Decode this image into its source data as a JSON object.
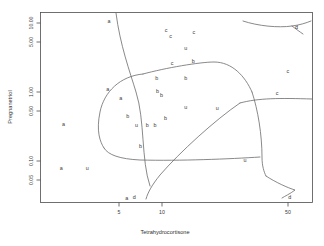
{
  "chart_data": {
    "type": "scatter",
    "title": "",
    "subtitle": "",
    "xlabel": "Tetrahydrocortisone",
    "ylabel": "Pregnanetriol",
    "xscale": "log",
    "yscale": "log",
    "xlim": [
      3.2,
      60
    ],
    "ylim": [
      0.035,
      13.5
    ],
    "xticks": [
      5,
      10,
      50
    ],
    "xticklabels": [
      "5",
      "10",
      "50"
    ],
    "yticks": [
      0.05,
      0.1,
      0.5,
      1.0,
      5.0,
      10.0
    ],
    "yticklabels": [
      "0.05",
      "0.10",
      "0.50",
      "1.00",
      "5.00",
      "10.00"
    ],
    "grid": false,
    "legend": "none",
    "annotation": "Classification partition boundaries drawn as curves separating groups a, b, c, u, d",
    "point_label_field": "Type",
    "groups": [
      "a",
      "b",
      "c",
      "u",
      "d"
    ],
    "points": [
      {
        "label": "a",
        "x": 6.7,
        "y": 10.2
      },
      {
        "label": "a",
        "x": 6.6,
        "y": 1.2
      },
      {
        "label": "a",
        "x": 4.1,
        "y": 0.4
      },
      {
        "label": "a",
        "x": 4.0,
        "y": 0.1
      },
      {
        "label": "a",
        "x": 7.6,
        "y": 0.9
      },
      {
        "label": "a",
        "x": 8.1,
        "y": 0.04
      },
      {
        "label": "b",
        "x": 8.2,
        "y": 0.52
      },
      {
        "label": "b",
        "x": 9.4,
        "y": 0.2
      },
      {
        "label": "b",
        "x": 11.2,
        "y": 1.7
      },
      {
        "label": "b",
        "x": 11.3,
        "y": 1.15
      },
      {
        "label": "b",
        "x": 11.8,
        "y": 1.0
      },
      {
        "label": "b",
        "x": 12.3,
        "y": 0.48
      },
      {
        "label": "b",
        "x": 15.3,
        "y": 1.7
      },
      {
        "label": "b",
        "x": 16.6,
        "y": 2.9
      },
      {
        "label": "b",
        "x": 10.1,
        "y": 0.39
      },
      {
        "label": "b",
        "x": 11.0,
        "y": 0.39
      },
      {
        "label": "c",
        "x": 12.4,
        "y": 7.6
      },
      {
        "label": "c",
        "x": 13.0,
        "y": 6.3
      },
      {
        "label": "c",
        "x": 16.7,
        "y": 7.3
      },
      {
        "label": "c",
        "x": 13.2,
        "y": 2.75
      },
      {
        "label": "c",
        "x": 46.0,
        "y": 2.1
      },
      {
        "label": "c",
        "x": 41.0,
        "y": 1.05
      },
      {
        "label": "u",
        "x": 15.3,
        "y": 4.4
      },
      {
        "label": "u",
        "x": 15.3,
        "y": 0.68
      },
      {
        "label": "u",
        "x": 9.0,
        "y": 0.39
      },
      {
        "label": "u",
        "x": 5.3,
        "y": 0.1
      },
      {
        "label": "u",
        "x": 21.5,
        "y": 0.66
      },
      {
        "label": "u",
        "x": 29.0,
        "y": 0.13
      },
      {
        "label": "d",
        "x": 50.5,
        "y": 8.5
      },
      {
        "label": "d",
        "x": 8.8,
        "y": 0.041
      },
      {
        "label": "d",
        "x": 47.0,
        "y": 0.041
      }
    ]
  },
  "axes": {
    "x_title": "Tetrahydrocortisone",
    "y_title": "Pregnanetriol"
  }
}
